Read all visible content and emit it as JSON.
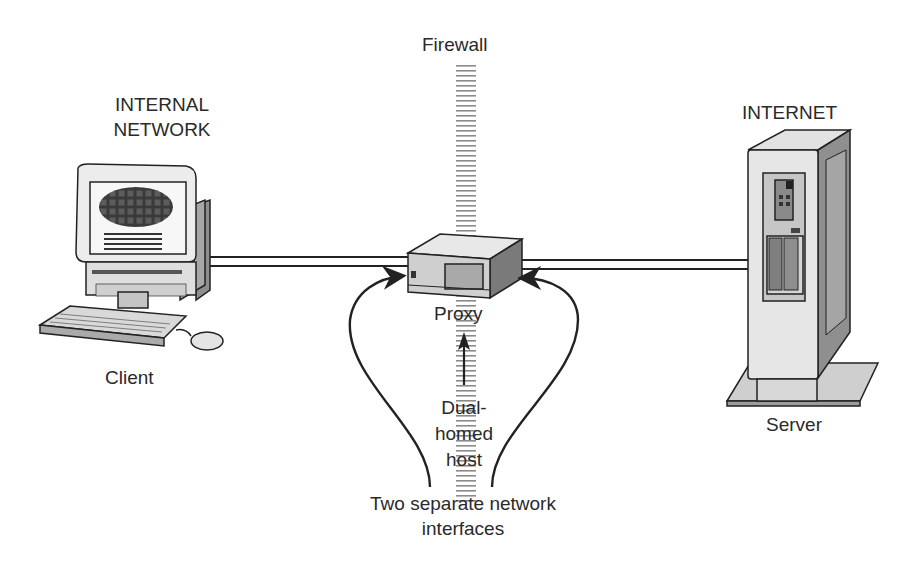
{
  "diagram": {
    "type": "network-topology",
    "nodes": [
      {
        "id": "client",
        "label": "Client",
        "zone_label": "INTERNAL NETWORK",
        "zone_line1": "INTERNAL",
        "zone_line2": "NETWORK",
        "icon": "desktop-computer-icon"
      },
      {
        "id": "proxy",
        "label": "Proxy",
        "icon": "proxy-box-icon"
      },
      {
        "id": "server",
        "label": "Server",
        "zone_label": "INTERNET",
        "icon": "tower-server-icon"
      }
    ],
    "firewall": {
      "label": "Firewall"
    },
    "edges": [
      {
        "from": "client",
        "to": "proxy",
        "style": "double-line"
      },
      {
        "from": "proxy",
        "to": "server",
        "style": "double-line"
      }
    ],
    "annotations": {
      "dual_homed_line1": "Dual-",
      "dual_homed_line2": "homed",
      "dual_homed_line3": "host",
      "interfaces_line1": "Two separate network",
      "interfaces_line2": "interfaces"
    }
  },
  "colors": {
    "line": "#222222",
    "device_light": "#e6e6e6",
    "device_mid": "#bdbdbd",
    "device_dark": "#7a7a7a",
    "firewall_dash": "#8a8a8a"
  }
}
